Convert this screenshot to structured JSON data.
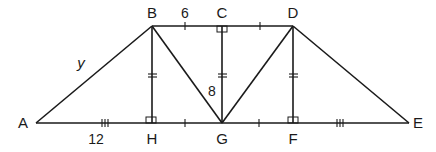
{
  "diagram": {
    "points": {
      "A": {
        "label": "A",
        "x": 36,
        "y": 123
      },
      "B": {
        "label": "B",
        "x": 152,
        "y": 26
      },
      "C": {
        "label": "C",
        "x": 222,
        "y": 26
      },
      "D": {
        "label": "D",
        "x": 293,
        "y": 26
      },
      "E": {
        "label": "E",
        "x": 409,
        "y": 123
      },
      "H": {
        "label": "H",
        "x": 152,
        "y": 123
      },
      "G": {
        "label": "G",
        "x": 222,
        "y": 123
      },
      "F": {
        "label": "F",
        "x": 293,
        "y": 123
      }
    },
    "segments": [
      "AB",
      "BD",
      "AE",
      "BH",
      "BG",
      "CG",
      "DG",
      "DF",
      "DE"
    ],
    "measures": {
      "BC": "6",
      "CG": "8",
      "AB": "y",
      "AH": "12"
    },
    "right_angles": [
      "C",
      "H",
      "F"
    ],
    "tick_marks": {
      "single": [
        "BC",
        "CD",
        "HG",
        "GF"
      ],
      "double": [
        "BH",
        "CG",
        "DF"
      ],
      "triple": [
        "AH",
        "FE"
      ]
    }
  }
}
